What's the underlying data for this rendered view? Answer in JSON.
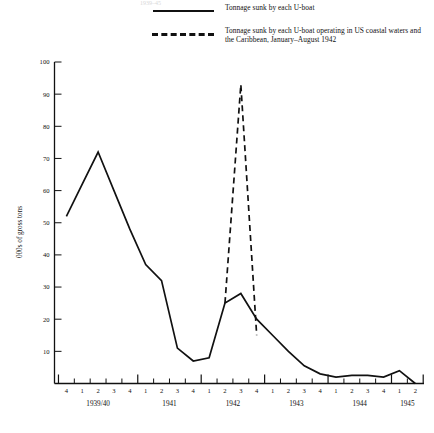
{
  "legend": {
    "entries": [
      {
        "style": "solid",
        "label": "Tonnage sunk by each U-boat"
      },
      {
        "style": "dashed",
        "label": "Tonnage sunk by each U-boat operating in US coastal waters and the Caribbean, January–August 1942"
      }
    ]
  },
  "masthead": {
    "cropped_text": "1939–45"
  },
  "chart_data": {
    "type": "line",
    "title": "",
    "xlabel": "",
    "ylabel": "000s of gross tons",
    "ylim": [
      0,
      100
    ],
    "ytick_values": [
      0,
      10,
      20,
      30,
      40,
      50,
      60,
      70,
      80,
      90,
      100
    ],
    "ytick_labels": [
      "",
      "10",
      "20",
      "30",
      "40",
      "50",
      "60",
      "70",
      "80",
      "90",
      "100"
    ],
    "grid": false,
    "legend_position": "top-right",
    "x_quarter_labels": [
      "4",
      "1",
      "2",
      "3",
      "4",
      "1",
      "2",
      "3",
      "4",
      "1",
      "2",
      "3",
      "4",
      "1",
      "2",
      "3",
      "4",
      "1",
      "2",
      "3",
      "4",
      "1",
      "2"
    ],
    "x_year_groups": [
      {
        "label": "1939/40",
        "start_index": 0,
        "end_index": 4
      },
      {
        "label": "1941",
        "start_index": 5,
        "end_index": 8
      },
      {
        "label": "1942",
        "start_index": 9,
        "end_index": 12
      },
      {
        "label": "1943",
        "start_index": 13,
        "end_index": 16
      },
      {
        "label": "1944",
        "start_index": 17,
        "end_index": 20
      },
      {
        "label": "1945",
        "start_index": 21,
        "end_index": 22
      }
    ],
    "series": [
      {
        "name": "Tonnage sunk by each U-boat",
        "style": "solid",
        "x_index": [
          0,
          1,
          2,
          3,
          4,
          5,
          6,
          7,
          8,
          9,
          10,
          11,
          12,
          13,
          14,
          15,
          16,
          17,
          18,
          19,
          20,
          21,
          22
        ],
        "values": [
          52,
          62,
          72,
          60,
          48,
          37,
          32,
          11,
          7,
          8,
          25,
          28,
          20,
          15,
          10,
          5.5,
          3,
          2,
          2.5,
          2.5,
          2,
          4,
          0
        ]
      },
      {
        "name": "Tonnage sunk by each U-boat operating in US coastal waters and the Caribbean, January–August 1942",
        "style": "dashed",
        "x_index": [
          10,
          11,
          12
        ],
        "values": [
          25,
          93,
          15
        ]
      }
    ]
  }
}
